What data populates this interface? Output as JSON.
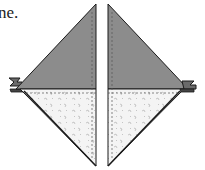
{
  "caption": {
    "text": "ne."
  },
  "diagram": {
    "colors": {
      "dark_fabric": "#8c8c8c",
      "light_fabric": "#f3f3f3",
      "outline": "#1a1a1a",
      "seam_line": "#666666",
      "print_dots": "#b5b5b5"
    },
    "units": [
      {
        "name": "left-unit",
        "top_fabric": "dark",
        "bottom_fabric": "light-print"
      },
      {
        "name": "right-unit",
        "top_fabric": "dark",
        "bottom_fabric": "light-print"
      }
    ]
  }
}
